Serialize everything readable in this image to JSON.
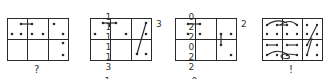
{
  "figure": {
    "colors": {
      "ink": "#2a2a2a",
      "background": "#ffffff"
    },
    "panels": [
      {
        "id": "panel-1",
        "caption": "?",
        "top_labels": [],
        "bottom_labels": [],
        "side_label": ""
      },
      {
        "id": "panel-2",
        "caption": "",
        "top_labels": [
          "1",
          "1",
          "1",
          "1",
          "1",
          "3"
        ],
        "bottom_labels": [
          "1",
          "0",
          "0",
          "1",
          "ω̄",
          "ω"
        ],
        "side_label": "3"
      },
      {
        "id": "panel-3",
        "caption": "",
        "top_labels": [
          "0",
          "2",
          "2",
          "0",
          "2",
          "2"
        ],
        "bottom_labels": [
          "0",
          "1",
          "1",
          "0",
          "ω̄",
          "ω"
        ],
        "side_label": "2"
      },
      {
        "id": "panel-4",
        "caption": "!",
        "top_labels": [],
        "bottom_labels": [],
        "side_label": ""
      }
    ]
  }
}
